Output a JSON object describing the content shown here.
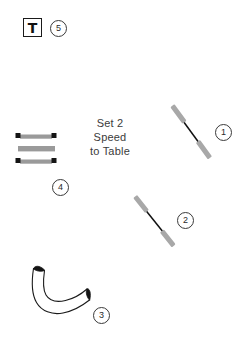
{
  "page": {
    "background_color": "#ffffff",
    "width": 245,
    "height": 342
  },
  "annotation": {
    "line1": "Set 2",
    "line2": "Speed",
    "line3": "to Table"
  },
  "tool_badge": {
    "glyph": "T",
    "icon_name": "tool-t-icon",
    "border_color": "#1a1a1a"
  },
  "callouts": [
    {
      "number": "1",
      "part": "rod-assembly-upper"
    },
    {
      "number": "2",
      "part": "rod-assembly-lower"
    },
    {
      "number": "3",
      "part": "curved-hose"
    },
    {
      "number": "4",
      "part": "bar-stack"
    },
    {
      "number": "5",
      "part": "tool-t"
    }
  ],
  "parts": {
    "rod_1": {
      "name": "rod-assembly-upper",
      "end_color": "#a8a8a8",
      "shaft_color": "#111111"
    },
    "rod_2": {
      "name": "rod-assembly-lower",
      "end_color": "#a8a8a8",
      "shaft_color": "#111111"
    },
    "hose_3": {
      "name": "curved-hose",
      "outline_color": "#1a1a1a",
      "opening_color": "#111111",
      "body_color": "#ffffff"
    },
    "bars_4": {
      "name": "bar-stack",
      "bar_color": "#9a9a9a",
      "cap_color": "#111111",
      "bar_count": 3,
      "capped_bars": [
        1,
        3
      ]
    }
  }
}
